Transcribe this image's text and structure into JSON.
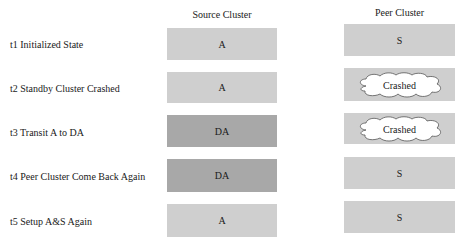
{
  "headers": {
    "source": "Source Cluster",
    "peer": "Peer Cluster"
  },
  "colors": {
    "light_box": "#cfcfcf",
    "dark_box": "#a8a8a8",
    "cloud_fill": "#ffffff"
  },
  "rows": [
    {
      "label": "t1 Initialized State",
      "source": "A",
      "source_shade": "light",
      "peer": "S",
      "peer_state": "normal"
    },
    {
      "label": "t2 Standby Cluster Crashed",
      "source": "A",
      "source_shade": "light",
      "peer": "Crashed",
      "peer_state": "crashed"
    },
    {
      "label": "t3 Transit A to DA",
      "source": "DA",
      "source_shade": "dark",
      "peer": "Crashed",
      "peer_state": "crashed"
    },
    {
      "label": "t4 Peer Cluster Come Back Again",
      "source": "DA",
      "source_shade": "dark",
      "peer": "S",
      "peer_state": "normal"
    },
    {
      "label": "t5 Setup A&S Again",
      "source": "A",
      "source_shade": "light",
      "peer": "S",
      "peer_state": "normal"
    }
  ]
}
